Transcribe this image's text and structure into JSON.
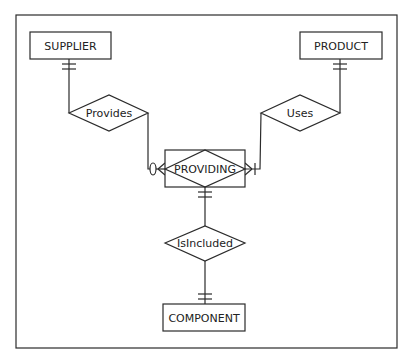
{
  "diagram": {
    "type": "entity-relationship",
    "notation": "crow's foot",
    "entities": [
      {
        "id": "supplier",
        "label": "SUPPLIER"
      },
      {
        "id": "product",
        "label": "PRODUCT"
      },
      {
        "id": "providing",
        "label": "PROVIDING",
        "kind": "associative entity"
      },
      {
        "id": "component",
        "label": "COMPONENT"
      }
    ],
    "relationships": [
      {
        "id": "provides",
        "label": "Provides",
        "from": "SUPPLIER",
        "to": "PROVIDING",
        "from_cardinality": "one and only one",
        "to_cardinality": "zero or many"
      },
      {
        "id": "uses",
        "label": "Uses",
        "from": "PRODUCT",
        "to": "PROVIDING",
        "from_cardinality": "one and only one",
        "to_cardinality": "one or many"
      },
      {
        "id": "isincluded",
        "label": "IsIncluded",
        "from": "PROVIDING",
        "to": "COMPONENT",
        "from_cardinality": "one and only one",
        "to_cardinality": "one and only one"
      }
    ]
  },
  "colors": {
    "line": "#2b2b2b",
    "background": "#ffffff",
    "text": "#222222"
  }
}
